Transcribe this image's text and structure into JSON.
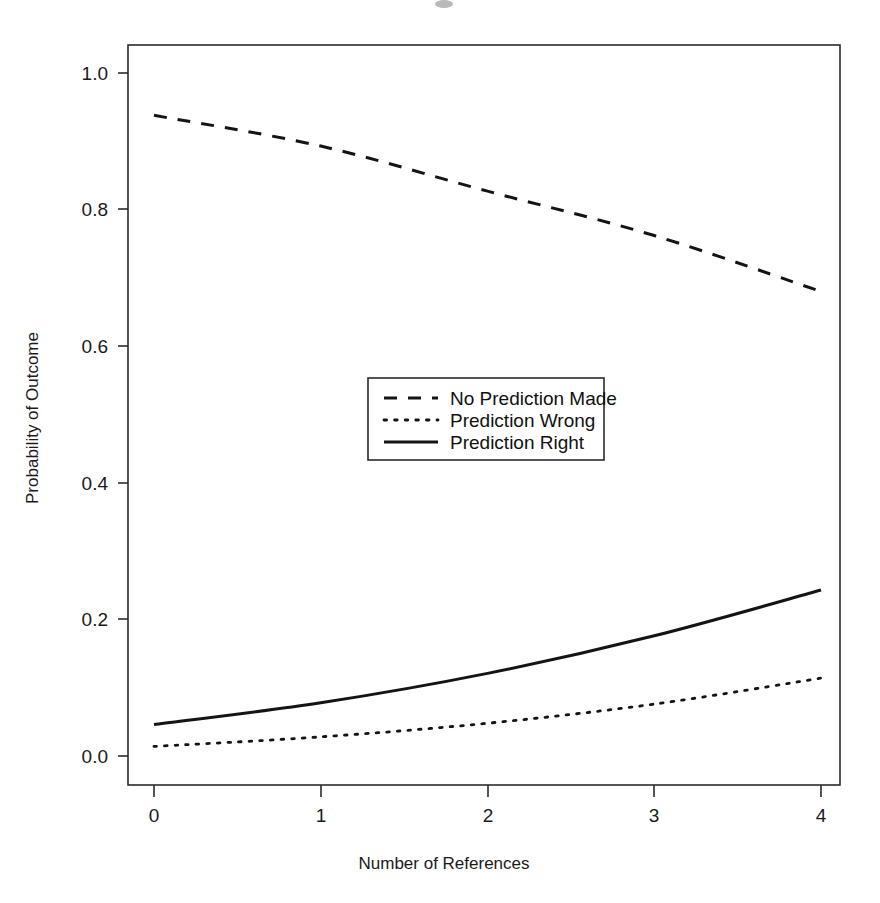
{
  "chart_data": {
    "type": "line",
    "title": "",
    "xlabel": "Number of References",
    "ylabel": "Probability of Outcome",
    "x": [
      0,
      1,
      2,
      3,
      4
    ],
    "xlim": [
      -0.16,
      4.12
    ],
    "ylim": [
      -0.035,
      1.07
    ],
    "xticks": [
      0,
      1,
      2,
      3,
      4
    ],
    "xticklabels": [
      "0",
      "1",
      "2",
      "3",
      "4"
    ],
    "yticks": [
      0.0,
      0.2,
      0.4,
      0.6,
      0.8,
      1.0
    ],
    "yticklabels": [
      "0.0",
      "0.2",
      "0.4",
      "0.6",
      "0.8",
      "1.0"
    ],
    "grid": false,
    "legend_position": "center",
    "series": [
      {
        "name": "No Prediction Made",
        "style": "dashed",
        "color": "#141414",
        "values": [
          0.938,
          0.893,
          0.827,
          0.762,
          0.68
        ]
      },
      {
        "name": "Prediction Wrong",
        "style": "dotted",
        "color": "#141414",
        "values": [
          0.014,
          0.028,
          0.048,
          0.076,
          0.114
        ]
      },
      {
        "name": "Prediction Right",
        "style": "solid",
        "color": "#141414",
        "values": [
          0.046,
          0.078,
          0.121,
          0.176,
          0.243
        ]
      }
    ]
  },
  "axes": {
    "y_tick_labels": [
      "1.0",
      "0.8",
      "0.6",
      "0.4",
      "0.2",
      "0.0"
    ],
    "x_tick_labels": [
      "0",
      "1",
      "2",
      "3",
      "4"
    ],
    "x_axis_title": "Number of References",
    "y_axis_title": "Probability of Outcome"
  },
  "legend": {
    "entries": [
      {
        "label": "No Prediction Made",
        "style": "dashed"
      },
      {
        "label": "Prediction Wrong",
        "style": "dotted"
      },
      {
        "label": "Prediction Right",
        "style": "solid"
      }
    ]
  }
}
